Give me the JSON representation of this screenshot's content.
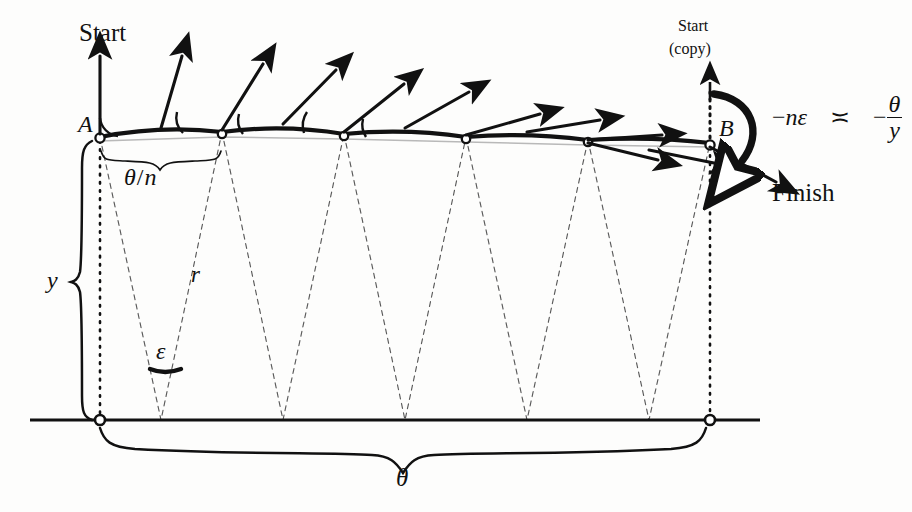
{
  "figure": {
    "background_color": "#fdfdfc",
    "ink_color": "#111111"
  },
  "labels": {
    "start": "Start",
    "start_copy_line1": "Start",
    "start_copy_line2": "(copy)",
    "finish": "Finish",
    "point_a": "A",
    "point_b": "B",
    "height_y": "y",
    "radius_r": "r",
    "segment_angle_num": "θ",
    "segment_angle_slash": "/",
    "segment_angle_den": "n",
    "epsilon": "ε",
    "total_angle": "θ"
  },
  "relation": {
    "lhs_minus": "−",
    "lhs_n": "n",
    "lhs_epsilon": "ε",
    "asymptotic_symbol": "≍",
    "rhs_minus": "−",
    "rhs_numerator": "θ",
    "rhs_denominator": "y",
    "plain_text": "−nε ≍ −θ/y"
  },
  "geometry": {
    "top_vertices_x": [
      100,
      222,
      344,
      466,
      588,
      710
    ],
    "top_vertices_y": [
      137,
      132,
      134,
      137,
      140,
      143
    ],
    "bottom_apexes_x": [
      161,
      283,
      405,
      527,
      649
    ],
    "baseline_y": 420,
    "baseline_x_start": 30,
    "baseline_x_end": 760,
    "vector_angles_deg": [
      90,
      74,
      58,
      44,
      30,
      16,
      4,
      -4
    ],
    "vector_length": 78,
    "description": "Six marked vertices along a gently arched polyline from A to B; dashed isoceles triangles drop from consecutive vertex pairs to apexes on the baseline; tangent vectors rotate clockwise from vertical at A to nearly horizontal at B."
  },
  "braces": {
    "theta_over_n": {
      "from_x": 100,
      "to_x": 222,
      "y": 152,
      "label": "θ/n"
    },
    "y_height": {
      "from_y": 140,
      "to_y": 420,
      "x": 83,
      "label": "y"
    },
    "theta_total": {
      "from_x": 100,
      "to_x": 710,
      "y": 430,
      "label": "θ"
    }
  }
}
